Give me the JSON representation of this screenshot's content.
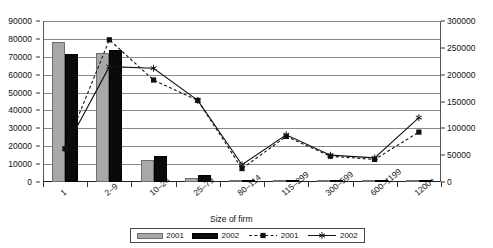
{
  "chart_data": {
    "type": "bar",
    "title": "",
    "xlabel": "Size of firm",
    "ylabel": "",
    "categories": [
      "1",
      "2–9",
      "10–24",
      "25–79",
      "80–114",
      "115–299",
      "300–599",
      "600–1199",
      "1200+"
    ],
    "left_axis": {
      "ticks": [
        "0",
        "10000",
        "20000",
        "30000",
        "40000",
        "50000",
        "60000",
        "70000",
        "80000",
        "90000"
      ],
      "min": 0,
      "max": 90000,
      "step": 10000
    },
    "right_axis": {
      "ticks": [
        "0",
        "50000",
        "100000",
        "150000",
        "200000",
        "250000",
        "300000"
      ],
      "min": 0,
      "max": 300000,
      "step": 50000
    },
    "grid": true,
    "legend_position": "bottom",
    "series": [
      {
        "name": "2001",
        "kind": "bar",
        "axis": "left",
        "color": "#a8a8a8",
        "values": [
          78000,
          72000,
          12200,
          2500,
          700,
          400,
          200,
          150,
          100
        ]
      },
      {
        "name": "2002",
        "kind": "bar",
        "axis": "left",
        "color": "#0a0a0a",
        "values": [
          71500,
          74000,
          14400,
          4000,
          900,
          500,
          250,
          180,
          120
        ]
      },
      {
        "name": "2001",
        "kind": "line-dashed-square",
        "axis": "right",
        "color": "#111111",
        "values": [
          62000,
          265000,
          190000,
          152000,
          25000,
          85000,
          48000,
          42000,
          93000
        ]
      },
      {
        "name": "2002",
        "kind": "line-solid-asterisk",
        "axis": "right",
        "color": "#111111",
        "values": [
          62000,
          215000,
          212000,
          152000,
          32000,
          88000,
          50000,
          45000,
          120000
        ]
      }
    ],
    "legend": [
      "2001",
      "2002",
      "2001",
      "2002"
    ]
  }
}
